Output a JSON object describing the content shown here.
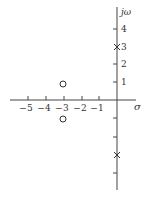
{
  "figure": {
    "type": "pole-zero plot",
    "axes": {
      "x_label": "σ",
      "y_label": "jω",
      "x_ticks": [
        -5,
        -4,
        -3,
        -2,
        -1
      ],
      "x_tick_labels": [
        "−5",
        "−4",
        "−3",
        "−2",
        "−1"
      ],
      "y_ticks": [
        4,
        3,
        2,
        1,
        -1,
        -2,
        -3,
        -4
      ],
      "y_tick_labels": [
        "4",
        "3",
        "2",
        "1"
      ]
    },
    "poles": [
      {
        "re": 0,
        "im": 3,
        "marker": "×"
      },
      {
        "re": 0,
        "im": -3,
        "marker": "×"
      }
    ],
    "zeros": [
      {
        "re": -3,
        "im": 1,
        "marker": "○"
      },
      {
        "re": -3,
        "im": -1,
        "marker": "○"
      }
    ],
    "colors": {
      "axis": "#444444",
      "text": "#333333",
      "background": "#ffffff"
    }
  }
}
